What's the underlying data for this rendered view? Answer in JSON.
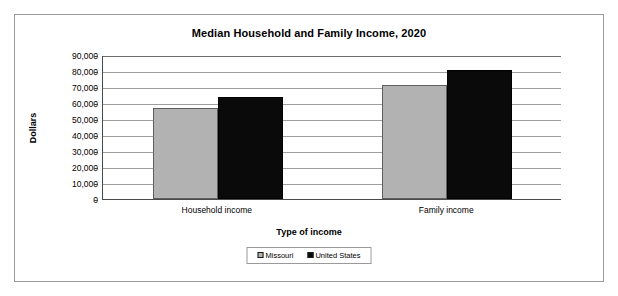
{
  "chart_data": {
    "type": "bar",
    "title": "Median Household and Family Income, 2020",
    "xlabel": "Type of income",
    "ylabel": "Dollars",
    "categories": [
      "Household income",
      "Family income"
    ],
    "series": [
      {
        "name": "Missouri",
        "color": "#b2b2b2",
        "values": [
          57000,
          71000
        ]
      },
      {
        "name": "United States",
        "color": "#0a0a0a",
        "values": [
          64000,
          80500
        ]
      }
    ],
    "ylim": [
      0,
      90000
    ],
    "ytick_values": [
      90000,
      80000,
      70000,
      60000,
      50000,
      40000,
      30000,
      20000,
      10000,
      0
    ],
    "ytick_labels": [
      "90,000",
      "80,000",
      "70,000",
      "60,000",
      "50,000",
      "40,000",
      "30,000",
      "20,000",
      "10,000",
      "0"
    ],
    "grid": true,
    "legend_position": "bottom-center"
  },
  "legend": {
    "entries": [
      {
        "label": "Missouri"
      },
      {
        "label": "United States"
      }
    ]
  }
}
